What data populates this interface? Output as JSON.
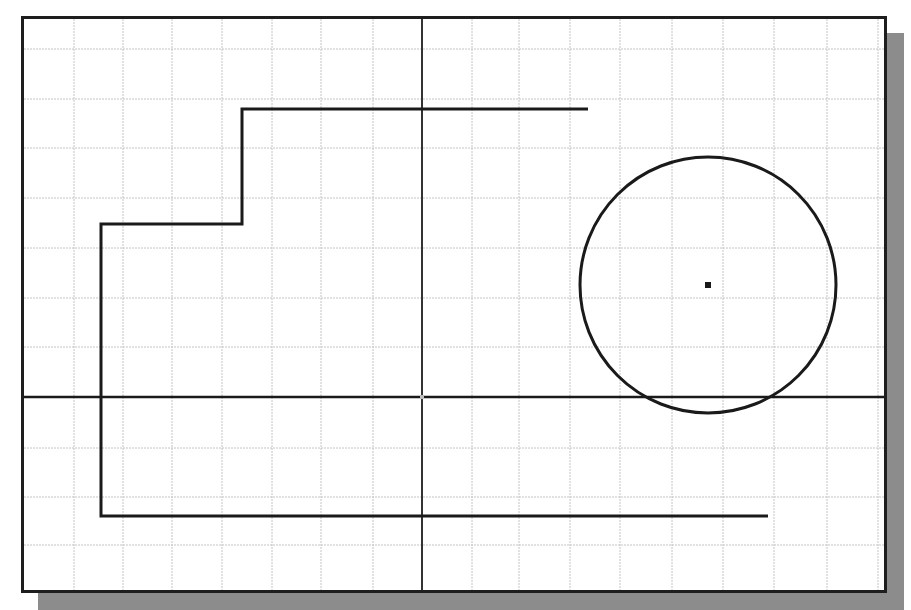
{
  "canvas": {
    "width": 911,
    "height": 610,
    "background": "#ffffff",
    "frame": {
      "x": 21,
      "y": 16,
      "width": 866,
      "height": 577,
      "border_color": "#1e1e1e"
    },
    "shadow": {
      "offset_x": 17,
      "offset_y": 17,
      "color": "#8c8c8c"
    }
  },
  "grid": {
    "color": "#c4c4c4",
    "vertical_lines_x": [
      74,
      123,
      172,
      222,
      272,
      321,
      373,
      472,
      519,
      570,
      620,
      672,
      723,
      774,
      827,
      878
    ],
    "horizontal_lines_y": [
      49,
      99,
      148,
      198,
      248,
      298,
      347,
      448,
      497,
      545
    ]
  },
  "axes": {
    "origin": {
      "x": 422,
      "y": 397
    },
    "x_axis": {
      "y": 397,
      "color": "#1a1a1a",
      "width": 2.5
    },
    "y_axis": {
      "x": 422,
      "color": "#333333",
      "width": 2
    },
    "origin_marker_color": "#bdbdbd"
  },
  "entities": {
    "polyline": {
      "label": "stepped polyline",
      "color": "#1a1a1a",
      "width": 3,
      "points": [
        [
          588,
          109
        ],
        [
          242,
          109
        ],
        [
          242,
          224
        ],
        [
          101,
          224
        ],
        [
          101,
          516
        ],
        [
          768,
          516
        ]
      ]
    },
    "circle": {
      "label": "circle",
      "cx": 708,
      "cy": 285,
      "r": 128,
      "color": "#1a1a1a",
      "width": 3,
      "center_marker": {
        "size": 6,
        "color": "#1a1a1a"
      }
    }
  }
}
